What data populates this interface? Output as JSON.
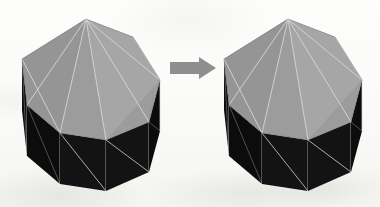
{
  "figure": {
    "background_color": "#fbfbfa",
    "arrow": {
      "icon": "right-arrow-icon",
      "label": "transforms to",
      "color": "#8e8e8e",
      "direction": "right",
      "x": 170,
      "y": 57,
      "width": 46,
      "height": 22
    },
    "colors": {
      "top_face": "#9c9c9c",
      "top_face_lit": "#a6a6a6",
      "top_face_shade": "#959595",
      "side_face": "#131313",
      "side_face_dark": "#0c0c0c",
      "wireframe": "#d9d9d9",
      "outline": "#5a5a5a"
    },
    "objects": [
      {
        "name": "left-polyhedron",
        "label": "Octagonal prism (before)",
        "position": "left",
        "bounds": {
          "x": 20,
          "y": 19,
          "width": 141,
          "height": 172
        },
        "top_face_sides": 8,
        "visible_side_faces": 4,
        "triangulated": true,
        "top_polygon": [
          [
            86,
            19
          ],
          [
            133,
            37
          ],
          [
            160,
            80
          ],
          [
            149,
            122
          ],
          [
            106,
            140
          ],
          [
            60,
            133
          ],
          [
            27,
            105
          ],
          [
            22,
            59
          ]
        ],
        "top_fan_apex": [
          86,
          19
        ],
        "silhouette": [
          [
            86,
            19
          ],
          [
            133,
            37
          ],
          [
            160,
            80
          ],
          [
            160,
            131
          ],
          [
            149,
            172
          ],
          [
            106,
            191
          ],
          [
            60,
            184
          ],
          [
            27,
            156
          ],
          [
            22,
            110
          ],
          [
            22,
            59
          ]
        ],
        "base_polygon": [
          [
            160,
            131
          ],
          [
            149,
            172
          ],
          [
            106,
            191
          ],
          [
            60,
            184
          ],
          [
            27,
            156
          ],
          [
            22,
            110
          ]
        ],
        "side_quads": [
          {
            "top": [
              [
                22,
                59
              ],
              [
                27,
                105
              ]
            ],
            "bottom": [
              [
                27,
                156
              ],
              [
                22,
                110
              ]
            ]
          },
          {
            "top": [
              [
                27,
                105
              ],
              [
                60,
                133
              ]
            ],
            "bottom": [
              [
                60,
                184
              ],
              [
                27,
                156
              ]
            ]
          },
          {
            "top": [
              [
                60,
                133
              ],
              [
                106,
                140
              ]
            ],
            "bottom": [
              [
                106,
                191
              ],
              [
                60,
                184
              ]
            ]
          },
          {
            "top": [
              [
                106,
                140
              ],
              [
                149,
                122
              ]
            ],
            "bottom": [
              [
                149,
                172
              ],
              [
                106,
                191
              ]
            ]
          },
          {
            "top": [
              [
                149,
                122
              ],
              [
                160,
                80
              ]
            ],
            "bottom": [
              [
                160,
                131
              ],
              [
                149,
                172
              ]
            ]
          }
        ]
      },
      {
        "name": "right-polyhedron",
        "label": "Octagonal prism (after)",
        "position": "right",
        "bounds": {
          "x": 222,
          "y": 19,
          "width": 140,
          "height": 172
        },
        "top_face_sides": 8,
        "visible_side_faces": 4,
        "triangulated": true,
        "top_polygon": [
          [
            288,
            19
          ],
          [
            335,
            37
          ],
          [
            362,
            80
          ],
          [
            351,
            122
          ],
          [
            308,
            140
          ],
          [
            262,
            133
          ],
          [
            229,
            105
          ],
          [
            224,
            59
          ]
        ],
        "top_fan_apex": [
          288,
          19
        ],
        "silhouette": [
          [
            288,
            19
          ],
          [
            335,
            37
          ],
          [
            362,
            80
          ],
          [
            362,
            131
          ],
          [
            351,
            172
          ],
          [
            308,
            191
          ],
          [
            262,
            184
          ],
          [
            229,
            156
          ],
          [
            224,
            110
          ],
          [
            224,
            59
          ]
        ],
        "base_polygon": [
          [
            362,
            131
          ],
          [
            351,
            172
          ],
          [
            308,
            191
          ],
          [
            262,
            184
          ],
          [
            229,
            156
          ],
          [
            224,
            110
          ]
        ],
        "side_quads": [
          {
            "top": [
              [
                224,
                59
              ],
              [
                229,
                105
              ]
            ],
            "bottom": [
              [
                229,
                156
              ],
              [
                224,
                110
              ]
            ]
          },
          {
            "top": [
              [
                229,
                105
              ],
              [
                262,
                133
              ]
            ],
            "bottom": [
              [
                262,
                184
              ],
              [
                229,
                156
              ]
            ]
          },
          {
            "top": [
              [
                262,
                133
              ],
              [
                308,
                140
              ]
            ],
            "bottom": [
              [
                308,
                191
              ],
              [
                262,
                184
              ]
            ]
          },
          {
            "top": [
              [
                308,
                140
              ],
              [
                351,
                122
              ]
            ],
            "bottom": [
              [
                351,
                172
              ],
              [
                308,
                191
              ]
            ]
          },
          {
            "top": [
              [
                351,
                122
              ],
              [
                362,
                80
              ]
            ],
            "bottom": [
              [
                362,
                131
              ],
              [
                351,
                172
              ]
            ]
          }
        ]
      }
    ]
  }
}
